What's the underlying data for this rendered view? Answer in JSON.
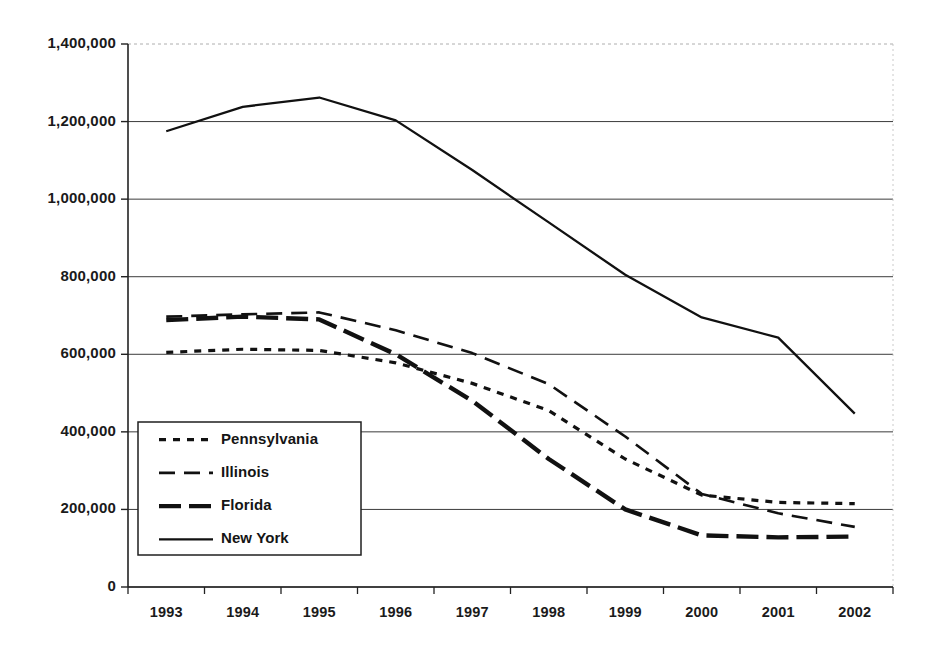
{
  "chart_data": {
    "type": "line",
    "title": "",
    "subtitle": "",
    "xlabel": "",
    "ylabel": "",
    "categories": [
      "1993",
      "1994",
      "1995",
      "1996",
      "1997",
      "1998",
      "1999",
      "2000",
      "2001",
      "2002"
    ],
    "ylim": [
      0,
      1400000
    ],
    "ytick_values": [
      0,
      200000,
      400000,
      600000,
      800000,
      1000000,
      1200000,
      1400000
    ],
    "ytick_labels": [
      "0",
      "200,000",
      "400,000",
      "600,000",
      "800,000",
      "1,000,000",
      "1,200,000",
      "1,400,000"
    ],
    "grid": true,
    "grid_axis": "y",
    "legend_position": "lower-left-inside",
    "series": [
      {
        "name": "Pennsylvania",
        "style": "dotted",
        "color": "#111111",
        "values": [
          605000,
          613000,
          610000,
          578000,
          525000,
          455000,
          330000,
          237000,
          218000,
          215000
        ]
      },
      {
        "name": "Illinois",
        "style": "dashed",
        "color": "#111111",
        "values": [
          697000,
          703000,
          708000,
          662000,
          603000,
          523000,
          388000,
          240000,
          190000,
          155000
        ]
      },
      {
        "name": "Florida",
        "style": "thick-dashed",
        "color": "#111111",
        "values": [
          688000,
          697000,
          690000,
          600000,
          480000,
          330000,
          200000,
          133000,
          128000,
          130000
        ]
      },
      {
        "name": "New York",
        "style": "solid",
        "color": "#111111",
        "values": [
          1175000,
          1238000,
          1262000,
          1203000,
          1075000,
          940000,
          805000,
          695000,
          643000,
          447000
        ]
      }
    ]
  },
  "legend": {
    "items": [
      {
        "label": "Pennsylvania",
        "style": "dotted"
      },
      {
        "label": "Illinois",
        "style": "dashed"
      },
      {
        "label": "Florida",
        "style": "thick-dashed"
      },
      {
        "label": "New York",
        "style": "solid"
      }
    ]
  },
  "axes": {
    "y_labels": [
      "1,400,000",
      "1,200,000",
      "1,000,000",
      "800,000",
      "600,000",
      "400,000",
      "200,000",
      "0"
    ],
    "x_labels": [
      "1993",
      "1994",
      "1995",
      "1996",
      "1997",
      "1998",
      "1999",
      "2000",
      "2001",
      "2002"
    ]
  }
}
